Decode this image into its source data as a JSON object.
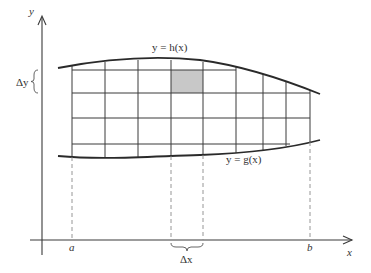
{
  "diagram": {
    "colors": {
      "line": "#3a3a3a",
      "dashed": "#8a8a8a",
      "shaded_cell": "#c8c8c8",
      "background": "#ffffff"
    },
    "axes": {
      "x_label": "x",
      "y_label": "y"
    },
    "labels": {
      "upper_curve": "y = h(x)",
      "lower_curve": "y = g(x)",
      "delta_y": "Δy",
      "delta_x": "Δx",
      "a": "a",
      "b": "b"
    },
    "grid": {
      "vertical_lines_x": [
        72,
        105,
        138,
        171,
        203,
        236,
        263,
        286,
        310
      ],
      "horizontal_lines_y": [
        70,
        93,
        118,
        144
      ],
      "shaded_cell": {
        "x0": 171,
        "x1": 203,
        "y0": 70,
        "y1": 93
      }
    }
  }
}
